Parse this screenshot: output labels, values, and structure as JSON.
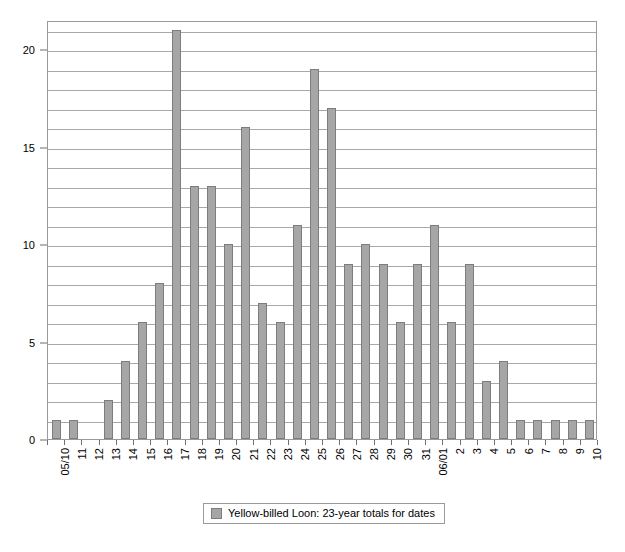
{
  "chart_data": {
    "type": "bar",
    "title": "",
    "subtitle": "",
    "xlabel": "",
    "ylabel": "",
    "ylim": [
      0,
      21.5
    ],
    "y_ticks_major": [
      0,
      5,
      10,
      15,
      20
    ],
    "y_tick_labels": [
      "0",
      "5",
      "10",
      "15",
      "20"
    ],
    "y_gridline_interval": 1,
    "grid": true,
    "legend_position": "bottom-center",
    "series_name": "Yellow-billed Loon: 23-year totals for dates",
    "bar_color": "#a6a6a6",
    "bar_border_color": "#7d7d7d",
    "grid_color": "#a8a8a8",
    "axis_color": "#9a9a9a",
    "categories": [
      "05/10",
      "11",
      "12",
      "13",
      "14",
      "15",
      "16",
      "17",
      "18",
      "19",
      "20",
      "21",
      "22",
      "23",
      "24",
      "25",
      "26",
      "27",
      "28",
      "29",
      "30",
      "31",
      "06/01",
      "2",
      "3",
      "4",
      "5",
      "6",
      "7",
      "8",
      "9",
      "10"
    ],
    "values": [
      1,
      1,
      0,
      2,
      4,
      6,
      8,
      21,
      13,
      13,
      10,
      16,
      7,
      6,
      11,
      19,
      17,
      9,
      10,
      9,
      6,
      9,
      11,
      6,
      9,
      3,
      4,
      1,
      1,
      1,
      1,
      1
    ]
  },
  "legend": {
    "entries": [
      {
        "label": "Yellow-billed Loon: 23-year totals for dates",
        "swatch_color": "#a6a6a6"
      }
    ]
  }
}
